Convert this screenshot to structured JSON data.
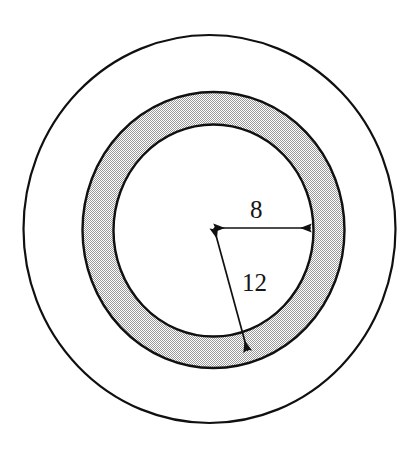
{
  "figure": {
    "type": "geometry-diagram",
    "background_color": "#ffffff",
    "stroke_color": "#101010",
    "shading_color": "#c9c9c9",
    "caption_faint": "",
    "labels": {
      "width_label": "8",
      "radius_label": "12"
    }
  },
  "chart_data": {
    "type": "diagram",
    "title": "",
    "shapes": [
      {
        "name": "outer-circle",
        "kind": "circle",
        "cx": 209.5,
        "cy": 229,
        "rx": 186,
        "ry": 194,
        "fill": "#ffffff",
        "stroke": "#101010",
        "stroke_width": 2.2
      },
      {
        "name": "shaded-annulus-outer",
        "kind": "circle",
        "cx": 213.5,
        "cy": 230,
        "rx": 131,
        "ry": 138,
        "fill": "#c9c9c9",
        "stroke": "#101010",
        "stroke_width": 2.4
      },
      {
        "name": "inner-circle",
        "kind": "circle",
        "cx": 213.5,
        "cy": 230.5,
        "rx": 100,
        "ry": 106,
        "fill": "#ffffff",
        "stroke": "#101010",
        "stroke_width": 2.4
      }
    ],
    "dimensions": [
      {
        "name": "width-dimension",
        "label": "8",
        "value": 8,
        "kind": "double-arrow",
        "from": [
          213,
          228
        ],
        "to": [
          312,
          228
        ],
        "label_pos": [
          258,
          210
        ],
        "meaning": "radius of the inner circle"
      },
      {
        "name": "radius-dimension",
        "label": "12",
        "value": 12,
        "kind": "double-arrow",
        "from": [
          213,
          228
        ],
        "to": [
          248,
          352
        ],
        "label_pos": [
          250,
          283
        ],
        "meaning": "radius to outer edge of shaded annulus"
      }
    ],
    "center_point": [
      213,
      228
    ],
    "annotations": [
      "8",
      "12"
    ]
  }
}
